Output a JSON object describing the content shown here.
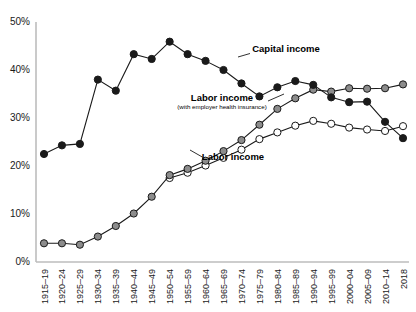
{
  "chart_data": {
    "type": "line",
    "title": "",
    "xlabel": "",
    "ylabel": "",
    "ylim": [
      0,
      50
    ],
    "ytick_labels": [
      "0%",
      "10%",
      "20%",
      "30%",
      "40%",
      "50%"
    ],
    "yticks": [
      0,
      10,
      20,
      30,
      40,
      50
    ],
    "grid": false,
    "legend": "inline annotations",
    "categories": [
      "1915–19",
      "1920–24",
      "1925–29",
      "1930–34",
      "1935–39",
      "1940–44",
      "1945–49",
      "1950–54",
      "1955–59",
      "1960–64",
      "1965–69",
      "1970–74",
      "1975–79",
      "1980–84",
      "1985–89",
      "1990–94",
      "1995–99",
      "2000–04",
      "2005–09",
      "2010–14",
      "2018"
    ],
    "series": [
      {
        "name": "Capital income",
        "marker": "filled-black-circle",
        "color": "#1a1a1a",
        "values": [
          22.5,
          24.3,
          24.6,
          38.0,
          35.7,
          43.3,
          42.3,
          45.9,
          43.3,
          41.9,
          40.0,
          37.2,
          34.5,
          36.4,
          37.7,
          36.9,
          34.3,
          33.3,
          33.4,
          29.2,
          25.8
        ]
      },
      {
        "name": "Labor income (with employer health insurance)",
        "marker": "filled-gray-circle",
        "color": "#8c8c8c",
        "values": [
          3.9,
          3.9,
          3.6,
          5.3,
          7.5,
          10.1,
          13.6,
          18.1,
          19.4,
          21.1,
          23.1,
          25.4,
          28.6,
          31.9,
          34.1,
          35.9,
          35.5,
          36.2,
          36.1,
          36.2,
          37.0
        ]
      },
      {
        "name": "Labor income",
        "marker": "open-white-circle",
        "color": "#ffffff",
        "values": [
          null,
          null,
          null,
          null,
          null,
          null,
          null,
          17.5,
          18.6,
          20.1,
          21.7,
          23.4,
          25.6,
          27.0,
          28.4,
          29.4,
          28.8,
          28.0,
          27.6,
          27.3,
          28.3
        ]
      }
    ],
    "annotations": [
      {
        "text": "Capital income",
        "sub": "",
        "x": 286,
        "y": 52
      },
      {
        "text": "Labor income",
        "sub": "(with employer health insurance)",
        "x": 222,
        "y": 101
      },
      {
        "text": "Labor income",
        "sub": "",
        "x": 233,
        "y": 160
      }
    ]
  }
}
